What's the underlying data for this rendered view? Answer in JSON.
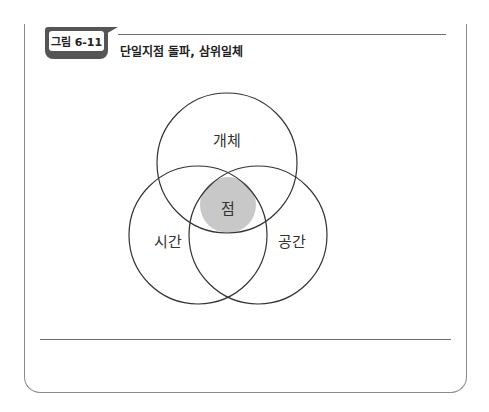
{
  "figure": {
    "label": "그림 6-11",
    "title": "단일지점 돌파, 삼위일체"
  },
  "venn": {
    "top_circle": {
      "label": "개체",
      "cx": 227,
      "cy": 163,
      "r": 70
    },
    "left_circle": {
      "label": "시간",
      "cx": 198,
      "cy": 235,
      "r": 69
    },
    "right_circle": {
      "label": "공간",
      "cx": 258,
      "cy": 235,
      "r": 69
    },
    "center": {
      "label": "점",
      "cx": 228,
      "cy": 205,
      "r": 28,
      "fill": "#c8c8c8"
    },
    "stroke_color": "#333333"
  },
  "colors": {
    "badge": "#555555",
    "frame": "#8a8a8a",
    "rule": "#6e6e6e"
  }
}
